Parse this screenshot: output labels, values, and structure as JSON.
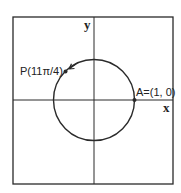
{
  "diagram": {
    "type": "unit-circle",
    "axes": {
      "x_label": "x",
      "y_label": "y"
    },
    "points": [
      {
        "id": "A",
        "label": "A=(1, 0)",
        "angle": "0"
      },
      {
        "id": "P",
        "label": "P(11π/4)",
        "angle": "11π/4"
      }
    ],
    "arrow": "counterclockwise toward P"
  },
  "colors": {
    "stroke": "#2a2a2a",
    "background": "#ffffff"
  }
}
